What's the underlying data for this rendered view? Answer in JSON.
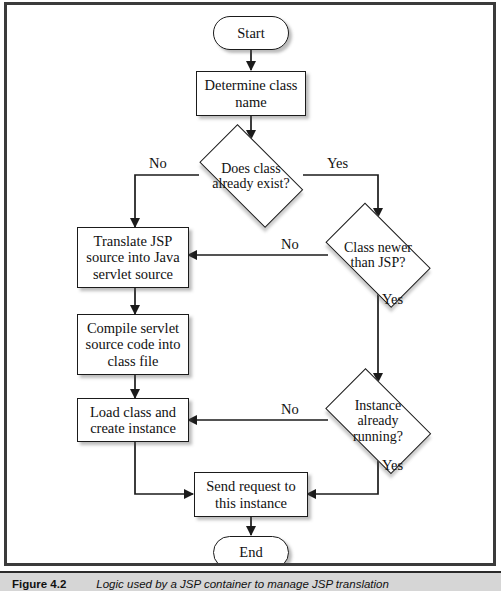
{
  "figure": {
    "caption_number": "Figure 4.2",
    "caption_text": "Logic used by a JSP container to manage JSP translation"
  },
  "colors": {
    "page_background": "#ffffff",
    "frame_border": "#3b3b3b",
    "shape_stroke": "#1b1b1b",
    "shape_fill": "#ffffff",
    "text": "#111111",
    "shadow": "rgba(80,80,80,0.38)",
    "caption_bar": "#d6d6d6"
  },
  "flowchart": {
    "type": "flowchart",
    "nodes": [
      {
        "id": "start",
        "shape": "terminator",
        "label": "Start"
      },
      {
        "id": "determine",
        "shape": "process",
        "label": "Determine class\nname"
      },
      {
        "id": "exists",
        "shape": "decision",
        "label": "Does class\nalready exist?"
      },
      {
        "id": "translate",
        "shape": "process",
        "label": "Translate JSP\nsource into Java\nservlet source"
      },
      {
        "id": "newer",
        "shape": "decision",
        "label": "Class newer\nthan JSP?"
      },
      {
        "id": "compile",
        "shape": "process",
        "label": "Compile servlet\nsource code into\nclass file"
      },
      {
        "id": "load",
        "shape": "process",
        "label": "Load class and\ncreate instance"
      },
      {
        "id": "running",
        "shape": "decision",
        "label": "Instance\nalready\nrunning?"
      },
      {
        "id": "send",
        "shape": "process",
        "label": "Send request to\nthis instance"
      },
      {
        "id": "end",
        "shape": "terminator",
        "label": "End"
      }
    ],
    "edges": [
      {
        "from": "start",
        "to": "determine",
        "label": ""
      },
      {
        "from": "determine",
        "to": "exists",
        "label": ""
      },
      {
        "from": "exists",
        "to": "translate",
        "label": "No"
      },
      {
        "from": "exists",
        "to": "newer",
        "label": "Yes"
      },
      {
        "from": "newer",
        "to": "translate",
        "label": "No"
      },
      {
        "from": "newer",
        "to": "running",
        "label": "Yes"
      },
      {
        "from": "translate",
        "to": "compile",
        "label": ""
      },
      {
        "from": "compile",
        "to": "load",
        "label": ""
      },
      {
        "from": "running",
        "to": "load",
        "label": "No"
      },
      {
        "from": "running",
        "to": "send",
        "label": "Yes"
      },
      {
        "from": "load",
        "to": "send",
        "label": ""
      },
      {
        "from": "send",
        "to": "end",
        "label": ""
      }
    ],
    "edge_labels": {
      "exists_no": "No",
      "exists_yes": "Yes",
      "newer_no": "No",
      "newer_yes": "Yes",
      "running_no": "No",
      "running_yes": "Yes"
    }
  }
}
